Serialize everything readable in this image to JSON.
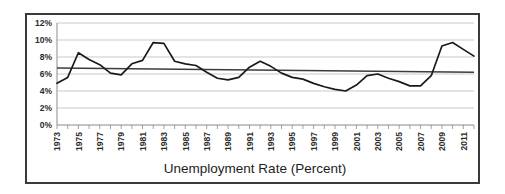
{
  "figure": {
    "title": "Unemployment Rate (Percent)",
    "frame_color": "#3a3a3a",
    "background_color": "#ffffff",
    "plot_background_color": "#ffffff"
  },
  "chart_data": {
    "type": "line",
    "title": "Unemployment Rate (Percent)",
    "xlabel": "",
    "ylabel": "",
    "ylim": [
      0,
      12
    ],
    "xlim": [
      1973,
      2012
    ],
    "grid": true,
    "legend": false,
    "ytick_labels": [
      "0%",
      "2%",
      "4%",
      "6%",
      "8%",
      "10%",
      "12%"
    ],
    "ytick_values": [
      0,
      2,
      4,
      6,
      8,
      10,
      12
    ],
    "xtick_labels": [
      "1973",
      "1975",
      "1977",
      "1979",
      "1981",
      "1983",
      "1985",
      "1987",
      "1989",
      "1991",
      "1993",
      "1995",
      "1997",
      "1999",
      "2001",
      "2003",
      "2005",
      "2007",
      "2009",
      "2011"
    ],
    "xtick_values": [
      1973,
      1975,
      1977,
      1979,
      1981,
      1983,
      1985,
      1987,
      1989,
      1991,
      1993,
      1995,
      1997,
      1999,
      2001,
      2003,
      2005,
      2007,
      2009,
      2011
    ],
    "x": [
      1973,
      1974,
      1975,
      1976,
      1977,
      1978,
      1979,
      1980,
      1981,
      1982,
      1983,
      1984,
      1985,
      1986,
      1987,
      1988,
      1989,
      1990,
      1991,
      1992,
      1993,
      1994,
      1995,
      1996,
      1997,
      1998,
      1999,
      2000,
      2001,
      2002,
      2003,
      2004,
      2005,
      2006,
      2007,
      2008,
      2009,
      2010,
      2011,
      2012
    ],
    "series": [
      {
        "name": "Unemployment Rate",
        "color": "#1a1a1a",
        "values": [
          4.9,
          5.6,
          8.5,
          7.7,
          7.1,
          6.1,
          5.9,
          7.2,
          7.6,
          9.7,
          9.6,
          7.5,
          7.2,
          7.0,
          6.2,
          5.5,
          5.3,
          5.6,
          6.8,
          7.5,
          6.9,
          6.1,
          5.6,
          5.4,
          4.9,
          4.5,
          4.2,
          4.0,
          4.7,
          5.8,
          6.0,
          5.5,
          5.1,
          4.6,
          4.6,
          5.8,
          9.3,
          9.7,
          8.9,
          8.1
        ]
      },
      {
        "name": "Trend",
        "color": "#3c3c3c",
        "type": "linear-trend",
        "start_value": 6.7,
        "end_value": 6.2
      }
    ]
  }
}
